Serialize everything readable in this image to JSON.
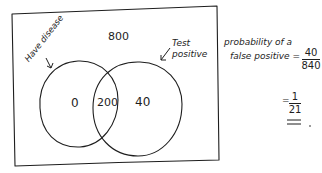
{
  "diagram": {
    "type": "venn",
    "style": "handwritten",
    "universe_total": "800",
    "sets": [
      {
        "id": "have-disease",
        "label": "Have disease"
      },
      {
        "id": "test-positive",
        "label": "Test positive"
      }
    ],
    "regions": {
      "disease_only": "0",
      "both": "200",
      "positive_only": "40"
    }
  },
  "calculation": {
    "line1": "probability of a",
    "line2": "false positive =",
    "fraction1": {
      "numerator": "40",
      "denominator": "840"
    },
    "equals": "=",
    "fraction2": {
      "numerator": "1",
      "denominator": "21"
    }
  },
  "colors": {
    "ink": "#1e1e1e",
    "background": "#ffffff"
  }
}
